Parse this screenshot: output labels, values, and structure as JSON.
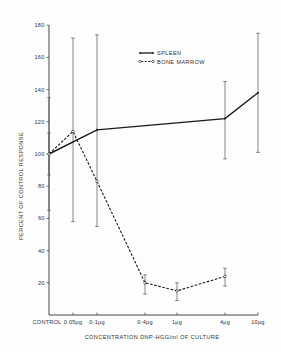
{
  "chart_data": {
    "type": "line",
    "title": "",
    "xlabel": "CONCENTRATION  DNP-HGG/ml OF CULTURE",
    "ylabel": "PERCENT OF CONTROL RESPONSE",
    "ylim": [
      0,
      180
    ],
    "yticks": [
      20,
      40,
      60,
      80,
      100,
      120,
      140,
      160,
      180
    ],
    "categories": [
      "CONTROL",
      "0·05μg",
      "0·1μg",
      "0·4μg",
      "1μg",
      "4μg",
      "10μg"
    ],
    "grid": false,
    "legend_position": "upper center",
    "series": [
      {
        "name": "SPLEEN",
        "style": "solid",
        "marker": "dot",
        "points": [
          {
            "x": "CONTROL",
            "y": 100,
            "err_low": 65,
            "err_high": 135
          },
          {
            "x": "0·1μg",
            "y": 115,
            "err_low": 55,
            "err_high": 174
          },
          {
            "x": "4μg",
            "y": 122,
            "err_low": 97,
            "err_high": 145
          },
          {
            "x": "10μg",
            "y": 138,
            "err_low": 101,
            "err_high": 175
          }
        ]
      },
      {
        "name": "BONE MARROW",
        "style": "dashed",
        "marker": "open-circle",
        "points": [
          {
            "x": "CONTROL",
            "y": 100,
            "err_low": 87,
            "err_high": 113
          },
          {
            "x": "0·05μg",
            "y": 114,
            "err_low": 58,
            "err_high": 172
          },
          {
            "x": "0·1μg",
            "y": 83,
            "err_low": null,
            "err_high": null
          },
          {
            "x": "0·4μg",
            "y": 20,
            "err_low": 13,
            "err_high": 25
          },
          {
            "x": "1μg",
            "y": 15,
            "err_low": 9,
            "err_high": 20
          },
          {
            "x": "4μg",
            "y": 24,
            "err_low": 18,
            "err_high": 29
          }
        ]
      }
    ]
  },
  "legend": {
    "items": [
      {
        "label": "SPLEEN",
        "style": "solid"
      },
      {
        "label": "BONE MARROW",
        "style": "dashed"
      }
    ]
  },
  "colors": {
    "line": "#1a1a1a",
    "axis": "#333333",
    "errorbar": "#555555",
    "background": "#fdfdfd"
  }
}
